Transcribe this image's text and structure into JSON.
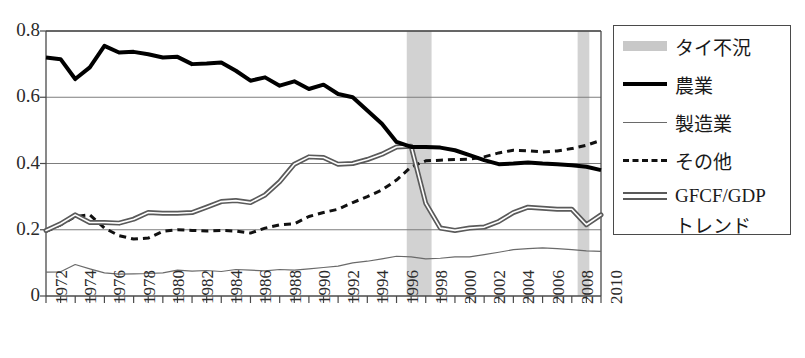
{
  "chart_data": {
    "type": "line",
    "title": "",
    "xlabel": "",
    "ylabel": "",
    "xlim": [
      1972,
      2010
    ],
    "ylim": [
      0,
      0.8
    ],
    "yticks": [
      0,
      0.2,
      0.4,
      0.6,
      0.8
    ],
    "ytick_labels": [
      "0",
      "0.2",
      "0.4",
      "0.6",
      "0.8"
    ],
    "xticks": [
      1972,
      1974,
      1976,
      1978,
      1980,
      1982,
      1984,
      1986,
      1988,
      1990,
      1992,
      1994,
      1996,
      1998,
      2000,
      2002,
      2004,
      2006,
      2008,
      2010
    ],
    "xtick_labels": [
      "1972",
      "1974",
      "1976",
      "1978",
      "1980",
      "1982",
      "1984",
      "1986",
      "1988",
      "1990",
      "1992",
      "1994",
      "1996",
      "1998",
      "2000",
      "2002",
      "2004",
      "2006",
      "2008",
      "2010"
    ],
    "x": [
      1972,
      1973,
      1974,
      1975,
      1976,
      1977,
      1978,
      1979,
      1980,
      1981,
      1982,
      1983,
      1984,
      1985,
      1986,
      1987,
      1988,
      1989,
      1990,
      1991,
      1992,
      1993,
      1994,
      1995,
      1996,
      1997,
      1998,
      1999,
      2000,
      2001,
      2002,
      2003,
      2004,
      2005,
      2006,
      2007,
      2008,
      2009,
      2010
    ],
    "grid": true,
    "grid_axis": "y",
    "legend_position": "right-outside",
    "series": [
      {
        "name": "農業",
        "style": "thick-solid",
        "color": "#000000",
        "width": 4,
        "values": [
          0.72,
          0.715,
          0.655,
          0.69,
          0.755,
          0.735,
          0.737,
          0.73,
          0.72,
          0.722,
          0.7,
          0.702,
          0.705,
          0.68,
          0.65,
          0.66,
          0.635,
          0.648,
          0.625,
          0.638,
          0.61,
          0.6,
          0.56,
          0.52,
          0.465,
          0.45,
          0.45,
          0.448,
          0.44,
          0.425,
          0.41,
          0.398,
          0.4,
          0.403,
          0.4,
          0.398,
          0.395,
          0.39,
          0.38
        ]
      },
      {
        "name": "製造業",
        "style": "thin-solid",
        "color": "#6a6a6a",
        "width": 1.2,
        "values": [
          0.072,
          0.073,
          0.095,
          0.082,
          0.07,
          0.066,
          0.067,
          0.068,
          0.07,
          0.078,
          0.075,
          0.077,
          0.074,
          0.08,
          0.078,
          0.076,
          0.08,
          0.078,
          0.082,
          0.086,
          0.09,
          0.1,
          0.105,
          0.112,
          0.12,
          0.118,
          0.112,
          0.114,
          0.118,
          0.118,
          0.125,
          0.132,
          0.14,
          0.143,
          0.145,
          0.143,
          0.14,
          0.136,
          0.135
        ]
      },
      {
        "name": "その他",
        "style": "dashed",
        "color": "#111111",
        "width": 3,
        "values": [
          0.195,
          0.215,
          0.24,
          0.245,
          0.205,
          0.182,
          0.172,
          0.175,
          0.195,
          0.2,
          0.198,
          0.196,
          0.198,
          0.196,
          0.19,
          0.205,
          0.215,
          0.218,
          0.24,
          0.252,
          0.262,
          0.282,
          0.3,
          0.32,
          0.35,
          0.39,
          0.408,
          0.41,
          0.412,
          0.413,
          0.42,
          0.432,
          0.44,
          0.438,
          0.435,
          0.438,
          0.445,
          0.455,
          0.47
        ]
      },
      {
        "name": "GFCF/GDP トレンド",
        "style": "double-line",
        "color": "#5a5a5a",
        "width": 5,
        "values": [
          0.198,
          0.218,
          0.245,
          0.222,
          0.222,
          0.22,
          0.232,
          0.252,
          0.25,
          0.25,
          0.252,
          0.268,
          0.285,
          0.288,
          0.282,
          0.305,
          0.345,
          0.398,
          0.42,
          0.418,
          0.398,
          0.4,
          0.412,
          0.428,
          0.45,
          0.452,
          0.28,
          0.205,
          0.198,
          0.205,
          0.208,
          0.225,
          0.252,
          0.268,
          0.265,
          0.262,
          0.262,
          0.215,
          0.245
        ]
      }
    ],
    "shaded_regions": [
      {
        "name": "タイ不況",
        "from": 1996.7,
        "to": 1998.4,
        "color": "#d2d2d2"
      },
      {
        "name": "タイ不況",
        "from": 2008.4,
        "to": 2009.2,
        "color": "#d2d2d2"
      }
    ]
  },
  "legend": {
    "items": [
      {
        "label": "タイ不況",
        "swatch": "band-swatch"
      },
      {
        "label": "農業",
        "swatch": "thick-line-swatch"
      },
      {
        "label": "製造業",
        "swatch": "thin-line-swatch"
      },
      {
        "label": "その他",
        "swatch": "dashed-line-swatch"
      },
      {
        "label": "GFCF/GDP",
        "label2": "トレンド",
        "swatch": "double-line-swatch"
      }
    ]
  }
}
